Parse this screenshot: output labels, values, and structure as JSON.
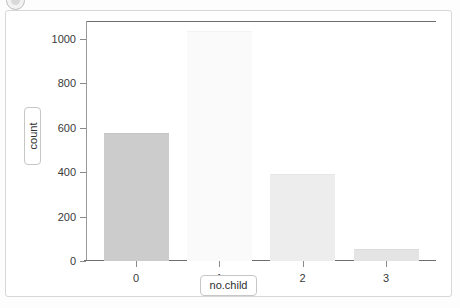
{
  "badge": {
    "name": "circular-badge-icon"
  },
  "chart_data": {
    "type": "bar",
    "title": "",
    "subtitle": "",
    "xlabel": "no.child",
    "ylabel": "count",
    "categories": [
      "0",
      "1",
      "2",
      "3"
    ],
    "values": [
      570,
      1030,
      385,
      48
    ],
    "series": [
      {
        "name": "count",
        "values": [
          570,
          1030,
          385,
          48
        ]
      }
    ],
    "bar_colors": [
      "#cccccc",
      "#fafafa",
      "#ededed",
      "#e4e4e4"
    ],
    "bar_edge_colors": [
      "#c4c4c4",
      "#f2f2f2",
      "#e6e6e6",
      "#dcdcdc"
    ],
    "ylim": [
      0,
      1080
    ],
    "xlim": [
      -0.6,
      3.6
    ],
    "yticks": [
      0,
      200,
      400,
      600,
      800,
      1000
    ],
    "ytick_labels": [
      "0",
      "200",
      "400",
      "600",
      "800",
      "1000"
    ],
    "xtick_labels": [
      "0",
      "1",
      "2",
      "3"
    ],
    "grid": false,
    "legend": false,
    "legend_position": "none",
    "panel_background": "#ffffff",
    "axis_color": "#6d6d6d",
    "tick_label_color": "#3a3a3a"
  }
}
